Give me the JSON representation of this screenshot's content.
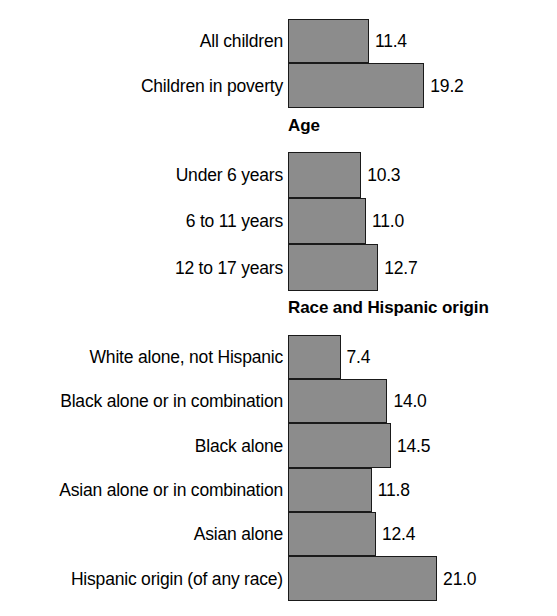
{
  "chart_data": {
    "type": "bar",
    "orientation": "horizontal",
    "title": "",
    "xlabel": "",
    "ylabel": "",
    "grid": false,
    "legend": "none",
    "xlim": [
      0,
      21.0
    ],
    "value_format": "one-decimal",
    "colors": {
      "bar_fill": "#8c8c8c",
      "bar_border": "#1a1a1a",
      "background": "#ffffff",
      "text": "#000000"
    },
    "groups": [
      {
        "heading": "",
        "categories": [
          "All children",
          "Children in poverty"
        ],
        "values": [
          11.4,
          19.2
        ]
      },
      {
        "heading": "Age",
        "categories": [
          "Under 6 years",
          "6 to 11 years",
          "12 to 17 years"
        ],
        "values": [
          10.3,
          11.0,
          12.7
        ]
      },
      {
        "heading": "Race and Hispanic origin",
        "categories": [
          "White alone, not Hispanic",
          "Black alone or in combination",
          "Black alone",
          "Asian alone or in combination",
          "Asian alone",
          "Hispanic origin (of any race)"
        ],
        "values": [
          7.4,
          14.0,
          14.5,
          11.8,
          12.4,
          21.0
        ]
      }
    ],
    "categories": [
      "All children",
      "Children in poverty",
      "Under 6 years",
      "6 to 11 years",
      "12 to 17 years",
      "White alone, not Hispanic",
      "Black alone or in combination",
      "Black alone",
      "Asian alone or in combination",
      "Asian alone",
      "Hispanic origin (of any race)"
    ],
    "values": [
      11.4,
      19.2,
      10.3,
      11.0,
      12.7,
      7.4,
      14.0,
      14.5,
      11.8,
      12.4,
      21.0
    ]
  },
  "bars": [
    {
      "label": "All children",
      "value": "11.4",
      "num": 11.4,
      "top": 19,
      "height": 44
    },
    {
      "label": "Children in poverty",
      "value": "19.2",
      "num": 19.2,
      "top": 63,
      "height": 45
    },
    {
      "label": "Under 6 years",
      "value": "10.3",
      "num": 10.3,
      "top": 152,
      "height": 46
    },
    {
      "label": "6 to 11 years",
      "value": "11.0",
      "num": 11.0,
      "top": 198,
      "height": 46
    },
    {
      "label": "12 to 17 years",
      "value": "12.7",
      "num": 12.7,
      "top": 244,
      "height": 47
    },
    {
      "label": "White alone, not Hispanic",
      "value": "7.4",
      "num": 7.4,
      "top": 335,
      "height": 44
    },
    {
      "label": "Black alone or in combination",
      "value": "14.0",
      "num": 14.0,
      "top": 379,
      "height": 44
    },
    {
      "label": "Black alone",
      "value": "14.5",
      "num": 14.5,
      "top": 423,
      "height": 45
    },
    {
      "label": "Asian alone or in combination",
      "value": "11.8",
      "num": 11.8,
      "top": 468,
      "height": 44
    },
    {
      "label": "Asian alone",
      "value": "12.4",
      "num": 12.4,
      "top": 512,
      "height": 44
    },
    {
      "label": "Hispanic origin (of any race)",
      "value": "21.0",
      "num": 21.0,
      "top": 556,
      "height": 45
    }
  ],
  "headings": [
    {
      "text": "Age",
      "top": 117
    },
    {
      "text": "Race and Hispanic origin",
      "top": 299
    }
  ],
  "scale": {
    "origin_x": 288,
    "px_per_unit": 7.1,
    "value_gap_px": 6
  }
}
